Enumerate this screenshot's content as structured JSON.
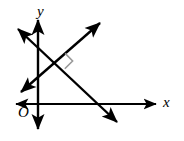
{
  "figure": {
    "kind": "coordinate-plane-diagram",
    "background_color": "#ffffff",
    "stroke_color": "#000000",
    "right_angle_color": "#9a9a9a",
    "labels": {
      "y_axis": "y",
      "x_axis": "x",
      "origin": "O"
    },
    "axes": {
      "x_axis": {
        "y": 104,
        "x_start": 14,
        "x_end": 158,
        "double_arrow": true
      },
      "y_axis": {
        "x": 38,
        "y_start": 18,
        "y_end": 131,
        "double_arrow": true
      }
    },
    "lines": [
      {
        "name": "line-negative-slope",
        "from": {
          "x": 15,
          "y": 26
        },
        "to": {
          "x": 120,
          "y": 125
        },
        "double_arrow": true,
        "slope_sign": "negative"
      },
      {
        "name": "line-positive-slope",
        "from": {
          "x": 18,
          "y": 95
        },
        "to": {
          "x": 103,
          "y": 20
        },
        "double_arrow": true,
        "slope_sign": "positive"
      }
    ],
    "intersection": {
      "x": 57,
      "y": 61
    },
    "right_angle_marker": {
      "present": true,
      "size": 11,
      "position": {
        "x": 57,
        "y": 61
      },
      "orientation": "upper-right-of-intersection"
    }
  }
}
